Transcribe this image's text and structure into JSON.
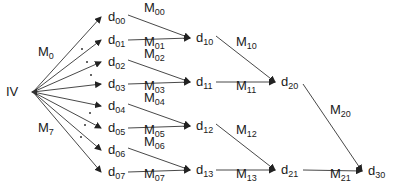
{
  "diagram": {
    "source_node": {
      "label": "IV",
      "x": 15,
      "y": 92,
      "tip_x": 31,
      "tip_y": 92
    },
    "level0": [
      {
        "base": "d",
        "sub": "00",
        "x": 108,
        "y": 17
      },
      {
        "base": "d",
        "sub": "01",
        "x": 108,
        "y": 40
      },
      {
        "base": "d",
        "sub": "02",
        "x": 108,
        "y": 62
      },
      {
        "base": "d",
        "sub": "03",
        "x": 108,
        "y": 84
      },
      {
        "base": "d",
        "sub": "04",
        "x": 108,
        "y": 106
      },
      {
        "base": "d",
        "sub": "05",
        "x": 108,
        "y": 128
      },
      {
        "base": "d",
        "sub": "06",
        "x": 108,
        "y": 150
      },
      {
        "base": "d",
        "sub": "07",
        "x": 108,
        "y": 172
      }
    ],
    "level1": [
      {
        "base": "d",
        "sub": "10",
        "x": 196,
        "y": 38
      },
      {
        "base": "d",
        "sub": "11",
        "x": 196,
        "y": 82
      },
      {
        "base": "d",
        "sub": "12",
        "x": 196,
        "y": 126
      },
      {
        "base": "d",
        "sub": "13",
        "x": 196,
        "y": 170
      }
    ],
    "level2": [
      {
        "base": "d",
        "sub": "20",
        "x": 281,
        "y": 82
      },
      {
        "base": "d",
        "sub": "21",
        "x": 281,
        "y": 170
      }
    ],
    "level3": [
      {
        "base": "d",
        "sub": "30",
        "x": 368,
        "y": 171
      }
    ],
    "source_edge_labels": [
      {
        "base": "M",
        "sub": "0",
        "x": 38,
        "y": 52
      },
      {
        "base": "M",
        "sub": "7",
        "x": 38,
        "y": 128
      }
    ],
    "edge_labels": [
      {
        "base": "M",
        "sub": "00",
        "x": 144,
        "y": 8
      },
      {
        "base": "M",
        "sub": "01",
        "x": 144,
        "y": 42
      },
      {
        "base": "M",
        "sub": "02",
        "x": 144,
        "y": 54
      },
      {
        "base": "M",
        "sub": "03",
        "x": 144,
        "y": 86
      },
      {
        "base": "M",
        "sub": "04",
        "x": 144,
        "y": 98
      },
      {
        "base": "M",
        "sub": "05",
        "x": 144,
        "y": 130
      },
      {
        "base": "M",
        "sub": "06",
        "x": 144,
        "y": 142
      },
      {
        "base": "M",
        "sub": "07",
        "x": 144,
        "y": 174
      },
      {
        "base": "M",
        "sub": "10",
        "x": 236,
        "y": 42
      },
      {
        "base": "M",
        "sub": "11",
        "x": 236,
        "y": 86
      },
      {
        "base": "M",
        "sub": "12",
        "x": 236,
        "y": 130
      },
      {
        "base": "M",
        "sub": "13",
        "x": 236,
        "y": 174
      },
      {
        "base": "M",
        "sub": "20",
        "x": 330,
        "y": 110
      },
      {
        "base": "M",
        "sub": "21",
        "x": 330,
        "y": 174
      }
    ],
    "ellipsis_dots_upper": [
      [
        81,
        48
      ],
      [
        86,
        61
      ],
      [
        90,
        74
      ]
    ],
    "ellipsis_dots_lower": [
      [
        89,
        112
      ],
      [
        84,
        124
      ],
      [
        80,
        136
      ]
    ],
    "colors": {
      "line": "#333333",
      "text": "#1a1a1a",
      "background": "#ffffff"
    }
  }
}
